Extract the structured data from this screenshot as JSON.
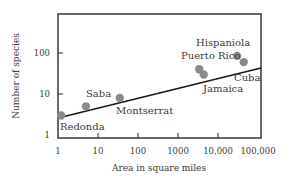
{
  "chart_data": {
    "type": "scatter",
    "title": "",
    "xlabel": "Area in square miles",
    "ylabel": "Number of species",
    "xscale": "log",
    "yscale": "log",
    "xlim": [
      1,
      100000
    ],
    "ylim": [
      1,
      400
    ],
    "x_ticks": [
      1,
      10,
      100,
      1000,
      10000,
      100000
    ],
    "x_tick_labels": [
      "1",
      "10",
      "100",
      "1000",
      "10,000",
      "100,000"
    ],
    "y_ticks": [
      1,
      10,
      100
    ],
    "y_tick_labels": [
      "1",
      "10",
      "100"
    ],
    "grid": false,
    "legend": null,
    "series": [
      {
        "name": "Islands",
        "points": [
          {
            "label": "Redonda",
            "x": 1.2,
            "y": 3
          },
          {
            "label": "Saba",
            "x": 5,
            "y": 5
          },
          {
            "label": "Montserrat",
            "x": 35,
            "y": 8
          },
          {
            "label": "Puerto Rico",
            "x": 3400,
            "y": 40
          },
          {
            "label": "Jamaica",
            "x": 4400,
            "y": 30
          },
          {
            "label": "Hispaniola",
            "x": 30000,
            "y": 85
          },
          {
            "label": "Cuba",
            "x": 44000,
            "y": 60
          }
        ]
      }
    ],
    "trendline": {
      "type": "power-law fit",
      "x_start": 1,
      "y_start": 2.8,
      "x_end": 100000,
      "y_end": 100
    }
  },
  "colors": {
    "frame": "#2a2a2a",
    "line": "#1a1a1a",
    "point": "#8a8a8a",
    "text": "#3a3a3a"
  }
}
